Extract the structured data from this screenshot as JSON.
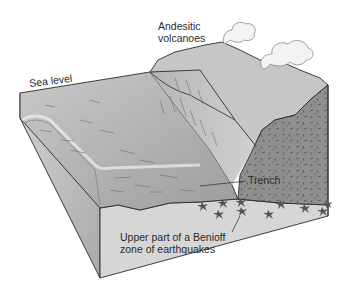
{
  "figure": {
    "labels": {
      "sea_level": "Sea level",
      "volcanoes_line1": "Andesitic",
      "volcanoes_line2": "volcanoes",
      "trench": "Trench",
      "benioff_line1": "Upper part of a Benioff",
      "benioff_line2": "zone of earthquakes"
    },
    "colors": {
      "ocean_floor": "#b8b8b8",
      "ocean_floor_dark": "#8e8e8e",
      "continent_surface": "#c4c4c4",
      "overriding_plate": "#8a8a8a",
      "block_front_face": "#d6d6d6",
      "block_left_face": "#bdbdbd",
      "outline": "#2a2a2a",
      "earthquake_star": "#5a5a5a",
      "plume": "#f2f2f2"
    },
    "earthquake_count": 10
  }
}
